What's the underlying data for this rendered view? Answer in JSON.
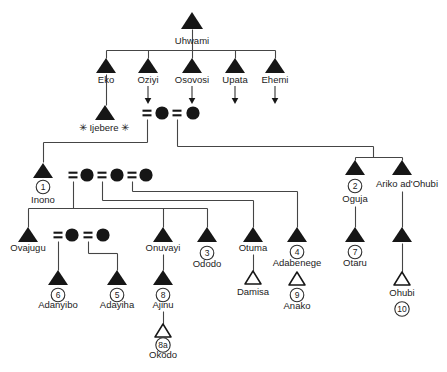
{
  "diagram": {
    "type": "kinship-genealogy-chart",
    "background_color": "#ffffff",
    "line_color": "#454545",
    "symbol_color": "#161616",
    "text_color": "#222222",
    "notation": {
      "male_symbol": "filled-triangle",
      "male_open_symbol": "open-triangle",
      "female_symbol": "filled-circle",
      "marriage_symbol": "=",
      "descendants_continue_symbol": "down-arrow"
    },
    "people": [
      {
        "id": "uhwami",
        "name": "Uhwami",
        "symbol": "male-filled"
      },
      {
        "id": "eko",
        "name": "Eko",
        "symbol": "male-filled"
      },
      {
        "id": "oziyi",
        "name": "Oziyi",
        "symbol": "male-filled",
        "descent_arrow": true
      },
      {
        "id": "osovosi",
        "name": "Osovosi",
        "symbol": "male-filled",
        "descent_arrow": true
      },
      {
        "id": "upata",
        "name": "Upata",
        "symbol": "male-filled",
        "descent_arrow": true
      },
      {
        "id": "ehemi",
        "name": "Ehemi",
        "symbol": "male-filled",
        "descent_arrow": true
      },
      {
        "id": "ijebere",
        "name": "Ijebere",
        "label": "✳ Ijebere ✳",
        "symbol": "male-filled"
      },
      {
        "id": "ijebere-wife-1",
        "name": "",
        "symbol": "female-filled"
      },
      {
        "id": "ijebere-wife-2",
        "name": "",
        "symbol": "female-filled"
      },
      {
        "id": "inono",
        "name": "Inono",
        "number": "1",
        "symbol": "male-filled"
      },
      {
        "id": "inono-wife-1",
        "name": "",
        "symbol": "female-filled"
      },
      {
        "id": "inono-wife-2",
        "name": "",
        "symbol": "female-filled"
      },
      {
        "id": "inono-wife-3",
        "name": "",
        "symbol": "female-filled"
      },
      {
        "id": "oguja",
        "name": "Oguja",
        "number": "2",
        "symbol": "male-filled"
      },
      {
        "id": "ariko-adohubi",
        "name": "Ariko ad'Ohubi",
        "symbol": "male-filled"
      },
      {
        "id": "ovajugu",
        "name": "Ovajugu",
        "symbol": "male-filled"
      },
      {
        "id": "ovajugu-wife-1",
        "name": "",
        "symbol": "female-filled"
      },
      {
        "id": "ovajugu-wife-2",
        "name": "",
        "symbol": "female-filled"
      },
      {
        "id": "onuvayi",
        "name": "Onuvayi",
        "symbol": "male-filled"
      },
      {
        "id": "ododo",
        "name": "Ododo",
        "number": "3",
        "symbol": "male-filled"
      },
      {
        "id": "otuma",
        "name": "Otuma",
        "symbol": "male-filled"
      },
      {
        "id": "adabenege",
        "name": "Adabenege",
        "number": "4",
        "symbol": "male-filled"
      },
      {
        "id": "otaru",
        "name": "Otaru",
        "number": "7",
        "symbol": "male-filled"
      },
      {
        "id": "ariko-son",
        "name": "",
        "symbol": "male-filled"
      },
      {
        "id": "adanyibo",
        "name": "Adanyibo",
        "number": "6",
        "symbol": "male-filled"
      },
      {
        "id": "adayiha",
        "name": "Adayiha",
        "number": "5",
        "symbol": "male-filled"
      },
      {
        "id": "ajinu",
        "name": "Ajinu",
        "number": "8",
        "symbol": "male-filled"
      },
      {
        "id": "damisa",
        "name": "Damisa",
        "symbol": "male-open"
      },
      {
        "id": "anako",
        "name": "Anako",
        "number": "9",
        "symbol": "male-open"
      },
      {
        "id": "ohubi",
        "name": "Ohubi",
        "number": "10",
        "symbol": "male-open",
        "number_below_name": true
      },
      {
        "id": "okodo",
        "name": "Okodo",
        "number": "8a",
        "symbol": "male-open"
      }
    ]
  }
}
